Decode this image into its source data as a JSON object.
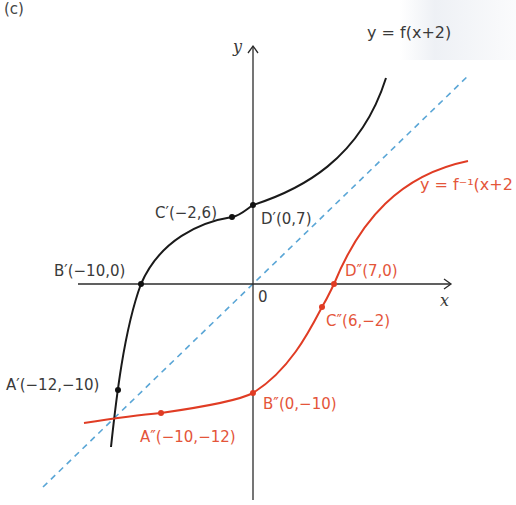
{
  "panel_label": "(c)",
  "axes": {
    "x_label": "x",
    "y_label": "y",
    "origin_label": "0"
  },
  "curves": {
    "f_shift": {
      "label": "y = f(x+2)",
      "color": "#1a1a1a"
    },
    "f_inverse_shift": {
      "label": "y = f⁻¹(x+2",
      "color": "#e03c24"
    },
    "mirror_line": {
      "label": "y = x",
      "color": "#5aa6d6",
      "style": "dashed"
    }
  },
  "points": {
    "A_prime": {
      "label": "A′(−12,−10)",
      "x": -12,
      "y": -10
    },
    "B_prime": {
      "label": "B′(−10,0)",
      "x": -10,
      "y": 0
    },
    "C_prime": {
      "label": "C′(−2,6)",
      "x": -2,
      "y": 6
    },
    "D_prime": {
      "label": "D′(0,7)",
      "x": 0,
      "y": 7
    },
    "A_dprime": {
      "label": "A″(−10,−12)",
      "x": -10,
      "y": -12
    },
    "B_dprime": {
      "label": "B″(0,−10)",
      "x": 0,
      "y": -10
    },
    "C_dprime": {
      "label": "C″(6,−2)",
      "x": 6,
      "y": -2
    },
    "D_dprime": {
      "label": "D″(7,0)",
      "x": 7,
      "y": 0
    }
  }
}
